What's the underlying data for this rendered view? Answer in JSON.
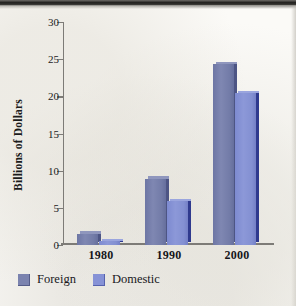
{
  "chart_data": {
    "type": "bar",
    "title": "",
    "xlabel": "",
    "ylabel": "Billions of Dollars",
    "categories": [
      "1980",
      "1990",
      "2000"
    ],
    "series": [
      {
        "name": "Foreign",
        "values": [
          1.5,
          8.9,
          24.3
        ],
        "color": "#7b83af"
      },
      {
        "name": "Domestic",
        "values": [
          0.5,
          5.9,
          20.4
        ],
        "color": "#8692d6"
      }
    ],
    "ylim": [
      0,
      30
    ],
    "yticks": [
      "0",
      "5",
      "10",
      "15",
      "20",
      "25",
      "30"
    ],
    "grid": false,
    "legend_position": "bottom-left"
  },
  "axis": {
    "y_label": "Billions of Dollars"
  },
  "legend": {
    "items": [
      {
        "label": "Foreign"
      },
      {
        "label": "Domestic"
      }
    ]
  }
}
